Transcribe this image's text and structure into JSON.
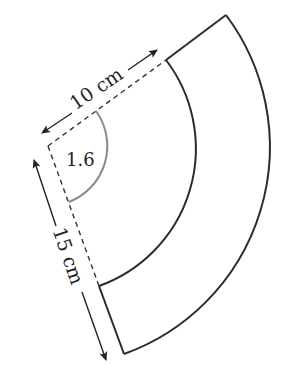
{
  "diagram": {
    "shape": "annular sector (arc band)",
    "labels": {
      "top_length": "10 cm",
      "side_length": "15 cm",
      "angle": "1.6"
    },
    "colors": {
      "outline": "#2b2b2b",
      "angle_arc": "#8a8a8a",
      "background": "#ffffff"
    }
  }
}
